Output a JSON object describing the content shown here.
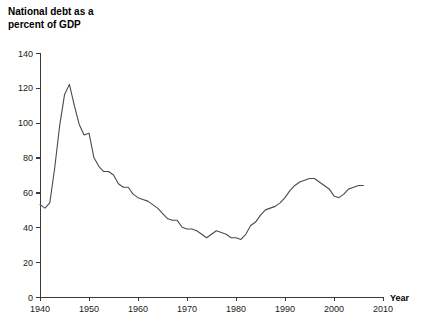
{
  "chart_data": {
    "type": "line",
    "title": "National debt as a\npercent of GDP",
    "title_line1": "National debt as a",
    "title_line2": "percent of GDP",
    "xlabel": "Year",
    "ylabel": "",
    "xlim": [
      1940,
      2010
    ],
    "ylim": [
      0,
      140
    ],
    "grid": false,
    "legend": "none",
    "line_color": "#4a4a4a",
    "axis_color": "#3a3a3a",
    "xticks": [
      1940,
      1950,
      1960,
      1970,
      1980,
      1990,
      2000,
      2010
    ],
    "xtick_labels": [
      "1940",
      "1950",
      "1960",
      "1970",
      "1980",
      "1990",
      "2000",
      "2010"
    ],
    "yticks": [
      0,
      20,
      40,
      60,
      80,
      100,
      120,
      140
    ],
    "ytick_labels": [
      "0",
      "20",
      "40",
      "60",
      "80",
      "100",
      "120",
      "140"
    ],
    "series": [
      {
        "name": "National debt as a percent of GDP",
        "x": [
          1940,
          1941,
          1942,
          1943,
          1944,
          1945,
          1946,
          1947,
          1948,
          1949,
          1950,
          1951,
          1952,
          1953,
          1954,
          1955,
          1956,
          1957,
          1958,
          1959,
          1960,
          1961,
          1962,
          1963,
          1964,
          1965,
          1966,
          1967,
          1968,
          1969,
          1970,
          1971,
          1972,
          1973,
          1974,
          1975,
          1976,
          1977,
          1978,
          1979,
          1980,
          1981,
          1982,
          1983,
          1984,
          1985,
          1986,
          1987,
          1988,
          1989,
          1990,
          1991,
          1992,
          1993,
          1994,
          1995,
          1996,
          1997,
          1998,
          1999,
          2000,
          2001,
          2002,
          2003,
          2004,
          2005,
          2006
        ],
        "values": [
          53,
          51,
          54,
          74,
          98,
          116,
          122,
          110,
          99,
          93,
          94,
          80,
          75,
          72,
          72,
          70,
          65,
          63,
          63,
          59,
          57,
          56,
          55,
          53,
          51,
          48,
          45,
          44,
          44,
          40,
          39,
          39,
          38,
          36,
          34,
          36,
          38,
          37,
          36,
          34,
          34,
          33,
          36,
          41,
          43,
          47,
          50,
          51,
          52,
          54,
          57,
          61,
          64,
          66,
          67,
          68,
          68,
          66,
          64,
          62,
          58,
          57,
          59,
          62,
          63,
          64,
          64
        ]
      }
    ]
  },
  "axis": {
    "x_axis_title": "Year"
  }
}
